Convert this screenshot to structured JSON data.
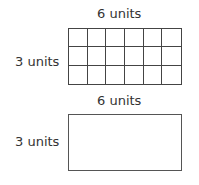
{
  "figures": [
    {
      "type": "grid-rectangle",
      "top_label": "6 units",
      "side_label": "3 units",
      "columns": 6,
      "rows": 3
    },
    {
      "type": "plain-rectangle",
      "top_label": "6 units",
      "side_label": "3 units"
    }
  ]
}
